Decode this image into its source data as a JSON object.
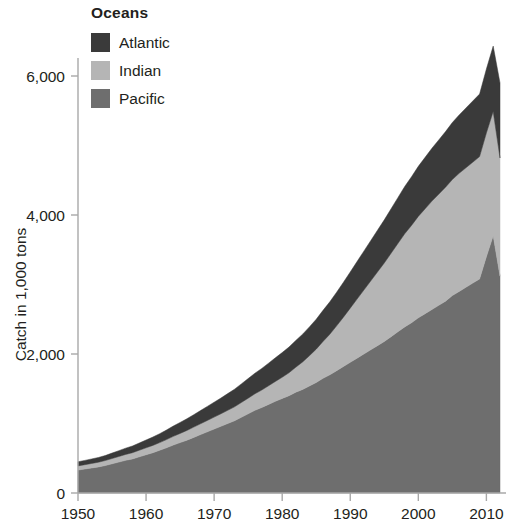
{
  "chart_data": {
    "type": "area",
    "title": "",
    "subtitle": "",
    "xlabel": "",
    "ylabel": "Catch in 1,000 tons",
    "xlim": [
      1950,
      2012
    ],
    "ylim": [
      0,
      6000
    ],
    "grid": false,
    "stacked": true,
    "stack_order_bottom_to_top": [
      "Pacific",
      "Indian",
      "Atlantic"
    ],
    "legend": {
      "title": "Oceans",
      "position": "top-left-inside",
      "entries": [
        {
          "name": "Atlantic",
          "color": "#3a3a3a"
        },
        {
          "name": "Indian",
          "color": "#b5b5b5"
        },
        {
          "name": "Pacific",
          "color": "#6e6e6e"
        }
      ]
    },
    "xticks": [
      1950,
      1960,
      1970,
      1980,
      1990,
      2000,
      2010
    ],
    "xtick_labels": [
      "1950",
      "1960",
      "1970",
      "1980",
      "1990",
      "2000",
      "2010"
    ],
    "yticks": [
      0,
      2000,
      4000,
      6000
    ],
    "ytick_labels": [
      "0",
      "2,000",
      "4,000",
      "6,000"
    ],
    "x": [
      1950,
      1951,
      1952,
      1953,
      1954,
      1955,
      1956,
      1957,
      1958,
      1959,
      1960,
      1961,
      1962,
      1963,
      1964,
      1965,
      1966,
      1967,
      1968,
      1969,
      1970,
      1971,
      1972,
      1973,
      1974,
      1975,
      1976,
      1977,
      1978,
      1979,
      1980,
      1981,
      1982,
      1983,
      1984,
      1985,
      1986,
      1987,
      1988,
      1989,
      1990,
      1991,
      1992,
      1993,
      1994,
      1995,
      1996,
      1997,
      1998,
      1999,
      2000,
      2001,
      2002,
      2003,
      2004,
      2005,
      2006,
      2007,
      2008,
      2009,
      2010,
      2011,
      2012
    ],
    "series": [
      {
        "name": "Pacific",
        "color": "#6e6e6e",
        "values": [
          330,
          345,
          360,
          375,
          395,
          420,
          445,
          470,
          490,
          520,
          550,
          580,
          615,
          650,
          690,
          725,
          760,
          800,
          840,
          880,
          920,
          960,
          1000,
          1040,
          1090,
          1140,
          1190,
          1230,
          1275,
          1320,
          1360,
          1400,
          1450,
          1490,
          1540,
          1590,
          1650,
          1700,
          1760,
          1820,
          1880,
          1940,
          2000,
          2060,
          2120,
          2180,
          2250,
          2320,
          2390,
          2450,
          2520,
          2580,
          2640,
          2700,
          2760,
          2840,
          2900,
          2960,
          3020,
          3080,
          3400,
          3700,
          3120
        ]
      },
      {
        "name": "Indian",
        "color": "#b5b5b5",
        "values": [
          60,
          62,
          65,
          68,
          72,
          76,
          80,
          85,
          90,
          95,
          100,
          105,
          110,
          118,
          125,
          132,
          140,
          148,
          156,
          164,
          172,
          180,
          190,
          200,
          212,
          224,
          238,
          252,
          268,
          285,
          305,
          330,
          360,
          395,
          435,
          480,
          530,
          585,
          645,
          710,
          780,
          850,
          920,
          990,
          1060,
          1130,
          1200,
          1270,
          1340,
          1400,
          1460,
          1510,
          1560,
          1600,
          1640,
          1670,
          1700,
          1720,
          1740,
          1760,
          1780,
          1790,
          1700
        ]
      },
      {
        "name": "Atlantic",
        "color": "#3a3a3a",
        "values": [
          60,
          62,
          65,
          68,
          72,
          78,
          84,
          90,
          96,
          104,
          112,
          120,
          128,
          138,
          148,
          158,
          168,
          178,
          190,
          202,
          214,
          226,
          240,
          254,
          268,
          282,
          296,
          310,
          325,
          340,
          355,
          370,
          385,
          400,
          415,
          430,
          448,
          466,
          484,
          502,
          520,
          540,
          560,
          580,
          600,
          620,
          640,
          660,
          680,
          700,
          720,
          740,
          760,
          780,
          800,
          820,
          840,
          860,
          880,
          900,
          920,
          940,
          1080
        ]
      }
    ]
  },
  "axis": {
    "y_title": "Catch in 1,000 tons"
  }
}
